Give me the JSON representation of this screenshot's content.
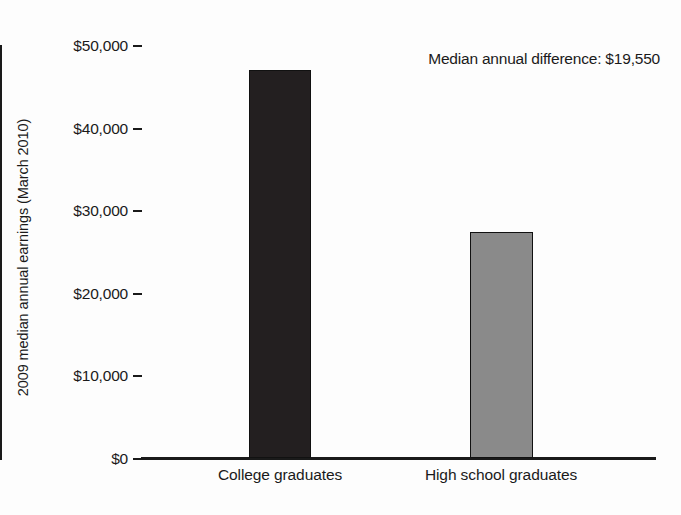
{
  "chart_data": {
    "type": "bar",
    "title": "",
    "subtitle": "",
    "xlabel": "",
    "ylabel": "2009 median annual earnings (March 2010)",
    "categories": [
      "College graduates",
      "High school graduates"
    ],
    "values": [
      46930,
      27380
    ],
    "value_labels": [
      "",
      ""
    ],
    "ylim": [
      0,
      50000
    ],
    "y_ticks": [
      0,
      10000,
      20000,
      30000,
      40000,
      50000
    ],
    "y_tick_labels": [
      "$0",
      "$10,000",
      "$20,000",
      "$30,000",
      "$40,000",
      "$50,000"
    ],
    "grid": false,
    "legend": "none",
    "annotations": [
      {
        "text": "Median annual difference: $19,550",
        "position": "top-right"
      }
    ],
    "series": [
      {
        "name": "2009 median annual earnings",
        "values": [
          46930,
          27380
        ],
        "colors": [
          "#231f20",
          "#8a8a8a"
        ]
      }
    ],
    "colors": {
      "bar_college": "#231f20",
      "bar_highschool": "#8a8a8a",
      "axis": "#1a1a1a",
      "text": "#1a1a1a",
      "background": "#fdfdfd"
    }
  },
  "axis": {
    "title_y": "2009 median annual earnings (March 2010)"
  },
  "annotation": {
    "text": "Median annual difference: $19,550"
  },
  "categories": {
    "college": "College graduates",
    "highschool": "High school graduates"
  },
  "ticks": {
    "t0": "$0",
    "t1": "$10,000",
    "t2": "$20,000",
    "t3": "$30,000",
    "t4": "$40,000",
    "t5": "$50,000"
  }
}
